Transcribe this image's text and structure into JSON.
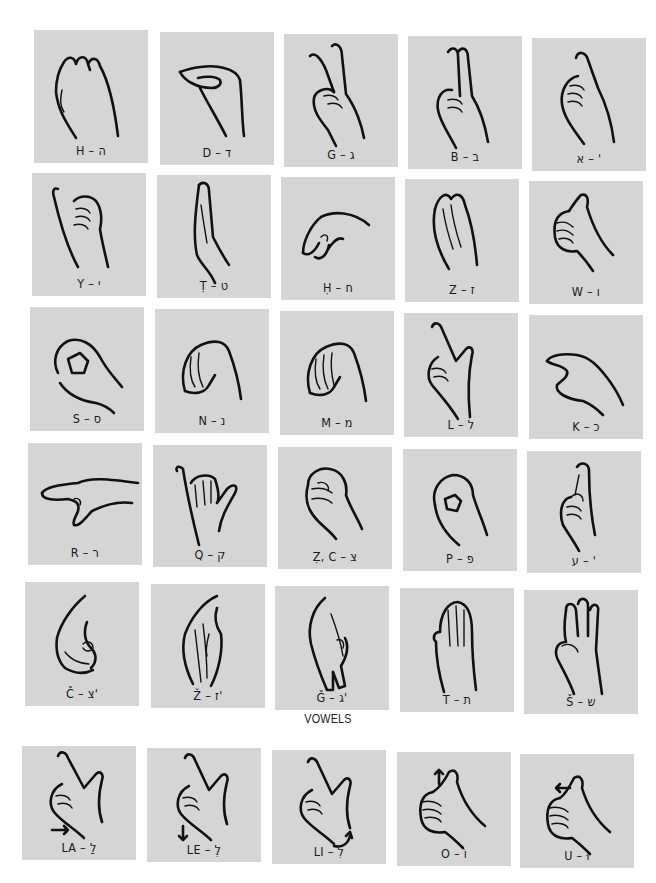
{
  "document": {
    "type": "Fingerspelling alphabet chart (Israeli Sign Language / Hebrew manual alphabet)",
    "tile_color": "#d5d5d5",
    "consonants": [
      {
        "row": 1,
        "tiles": [
          {
            "label": "H – ה",
            "latin": "H",
            "hebrew": "ה",
            "shape": "curved-fingers-together"
          },
          {
            "label": "D – ד",
            "latin": "D",
            "hebrew": "ד",
            "shape": "flat-hand-pinch-sideways"
          },
          {
            "label": "G – ג",
            "latin": "G",
            "hebrew": "ג",
            "shape": "v-sign"
          },
          {
            "label": "B – ב",
            "latin": "B",
            "hebrew": "ב",
            "shape": "two-fingers-together-up"
          },
          {
            "label": "א – '",
            "latin": "'",
            "hebrew": "א",
            "shape": "index-up-fist"
          }
        ]
      },
      {
        "row": 2,
        "tiles": [
          {
            "label": "Y – י",
            "latin": "Y",
            "hebrew": "י",
            "shape": "pinky-up-fist"
          },
          {
            "label": "Ṭ – ט",
            "latin": "Ṭ",
            "hebrew": "ט",
            "shape": "flat-hand-edge"
          },
          {
            "label": "Ḥ – ח",
            "latin": "Ḥ",
            "hebrew": "ח",
            "shape": "bent-hand-sideways"
          },
          {
            "label": "Z – ז",
            "latin": "Z",
            "hebrew": "ז",
            "shape": "flat-hand-up"
          },
          {
            "label": "W – ו",
            "latin": "W",
            "hebrew": "ו",
            "shape": "thumbs-up"
          }
        ]
      },
      {
        "row": 3,
        "tiles": [
          {
            "label": "S – ס",
            "latin": "S",
            "hebrew": "ס",
            "shape": "o-circle"
          },
          {
            "label": "N – נ",
            "latin": "N",
            "hebrew": "נ",
            "shape": "bent-fingers-down"
          },
          {
            "label": "M – מ",
            "latin": "M",
            "hebrew": "מ",
            "shape": "bent-fingers-down"
          },
          {
            "label": "L – ל",
            "latin": "L",
            "hebrew": "ל",
            "shape": "l-shape"
          },
          {
            "label": "K – כ",
            "latin": "K",
            "hebrew": "כ",
            "shape": "c-shape"
          }
        ]
      },
      {
        "row": 4,
        "tiles": [
          {
            "label": "R – ר",
            "latin": "R",
            "hebrew": "ר",
            "shape": "index-pointing-left"
          },
          {
            "label": "Q – ק",
            "latin": "Q",
            "hebrew": "ק",
            "shape": "y-hand"
          },
          {
            "label": "Ẓ, C – צ",
            "latin": "Ẓ, C",
            "hebrew": "צ",
            "shape": "fist"
          },
          {
            "label": "P – פ",
            "latin": "P",
            "hebrew": "פ",
            "shape": "o-pinch"
          },
          {
            "label": "ע – '",
            "latin": "'",
            "hebrew": "ע",
            "shape": "crossed-fingers"
          }
        ]
      },
      {
        "row": 5,
        "tiles": [
          {
            "label": "Č – צ'",
            "latin": "Č",
            "hebrew": "צ'",
            "shape": "hooked-hand"
          },
          {
            "label": "Ž – ז'",
            "latin": "Ž",
            "hebrew": "ז'",
            "shape": "hand-down"
          },
          {
            "label": "Ǧ – ג'",
            "latin": "Ǧ",
            "hebrew": "ג'",
            "shape": "v-down"
          },
          {
            "label": "T – ת",
            "latin": "T",
            "hebrew": "ת",
            "shape": "flat-hand-palm"
          },
          {
            "label": "Š – ש",
            "latin": "Š",
            "hebrew": "ש",
            "shape": "three-fingers-up"
          }
        ]
      }
    ],
    "vowels_heading": "VOWELS",
    "vowels": [
      {
        "label": "LA – לַ",
        "latin": "LA",
        "hebrew": "לַ",
        "shape": "l-shape",
        "motion": "arrow-right"
      },
      {
        "label": "LE – לֶ",
        "latin": "LE",
        "hebrew": "לֶ",
        "shape": "l-shape",
        "motion": "arrow-down"
      },
      {
        "label": "LI – לִ",
        "latin": "LI",
        "hebrew": "לִ",
        "shape": "l-shape",
        "motion": "twist-arrow"
      },
      {
        "label": "O – וֹ",
        "latin": "O",
        "hebrew": "וֹ",
        "shape": "thumbs-up",
        "motion": "arrow-up"
      },
      {
        "label": "U – וּ",
        "latin": "U",
        "hebrew": "וּ",
        "shape": "thumbs-up",
        "motion": "arrow-left"
      }
    ]
  }
}
